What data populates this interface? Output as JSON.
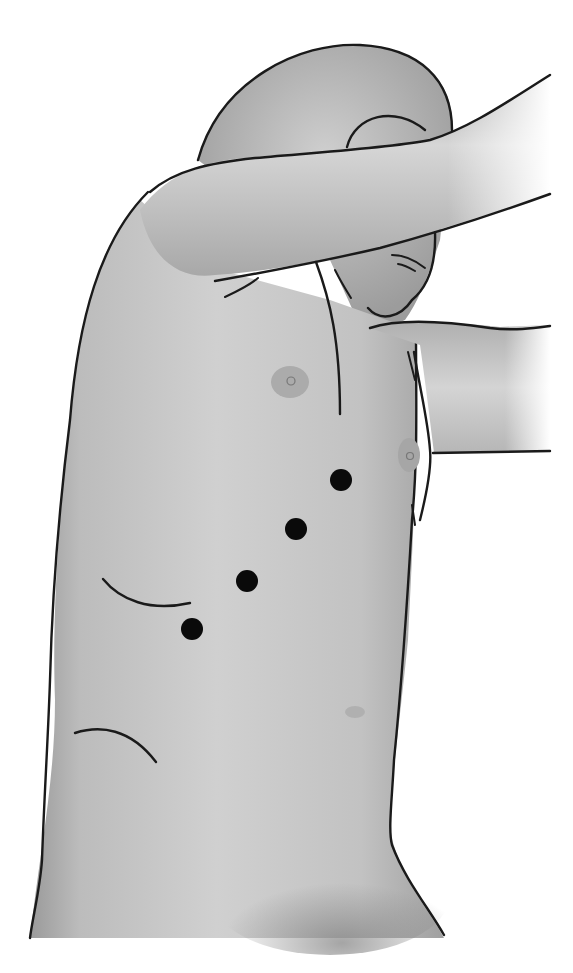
{
  "figure": {
    "colors": {
      "background": "#ffffff",
      "skin_light": "#d2d2d2",
      "skin_mid": "#bdbdbd",
      "skin_dark": "#8e8e8e",
      "outline": "#1a1a1a",
      "port_marker": "#0a0a0a",
      "nipple": "#a9a9a9"
    },
    "port_markers": [
      {
        "id": 1,
        "cx": 341,
        "cy": 480,
        "r": 11
      },
      {
        "id": 2,
        "cx": 296,
        "cy": 529,
        "r": 11
      },
      {
        "id": 3,
        "cx": 247,
        "cy": 581,
        "r": 11
      },
      {
        "id": 4,
        "cx": 192,
        "cy": 629,
        "r": 11
      }
    ],
    "nipples": [
      {
        "cx": 290,
        "cy": 382,
        "rx": 19,
        "ry": 16
      },
      {
        "cx": 409,
        "cy": 455,
        "rx": 11,
        "ry": 17
      }
    ]
  }
}
